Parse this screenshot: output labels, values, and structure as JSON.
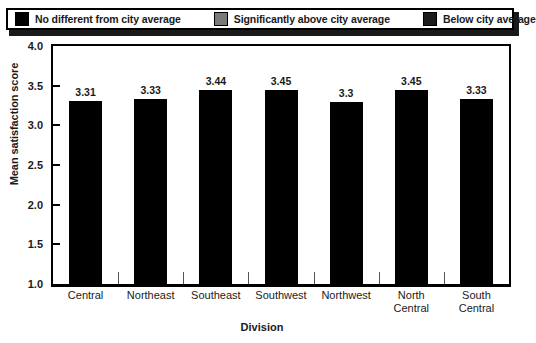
{
  "legend": {
    "items": [
      {
        "label": "No different from city average",
        "color": "#000000",
        "swatch": "legend-swatch-black"
      },
      {
        "label": "Significantly above city average",
        "color": "#7a7a7a",
        "swatch": "legend-swatch-gray"
      },
      {
        "label": "Below city average",
        "color": "#1c1c1c",
        "swatch": "legend-swatch-darkgray"
      }
    ]
  },
  "chart_data": {
    "type": "bar",
    "title": "",
    "xlabel": "Division",
    "ylabel": "Mean satisfaction score",
    "categories": [
      "Central",
      "Northeast",
      "Southeast",
      "Southwest",
      "Northwest",
      "North\nCentral",
      "South\nCentral"
    ],
    "values": [
      3.31,
      3.33,
      3.44,
      3.45,
      3.3,
      3.45,
      3.33
    ],
    "value_labels": [
      "3.31",
      "3.33",
      "3.44",
      "3.45",
      "3.3",
      "3.45",
      "3.33"
    ],
    "bar_color": "#000000",
    "ylim": [
      1.0,
      4.0
    ],
    "ytick_labels": [
      "4.0",
      "3.5",
      "3.0",
      "2.5",
      "2.0",
      "1.5",
      "1.0"
    ],
    "ytick_values": [
      4.0,
      3.5,
      3.0,
      2.5,
      2.0,
      1.5,
      1.0
    ],
    "grid": false,
    "legend_position": "top"
  }
}
